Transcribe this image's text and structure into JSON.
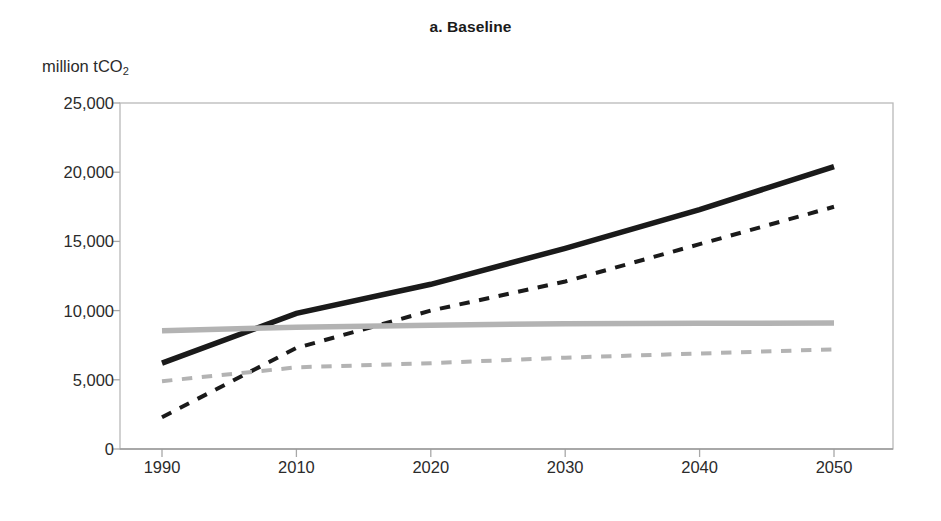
{
  "figure": {
    "title": "a. Baseline",
    "y_axis_unit_prefix": "million tCO",
    "y_axis_unit_subscript": "2"
  },
  "chart_data": {
    "type": "line",
    "title": "a. Baseline",
    "xlabel": "",
    "ylabel": "million tCO2",
    "ylim": [
      0,
      25000
    ],
    "xlim": [
      1990,
      2050
    ],
    "grid": false,
    "legend": "none",
    "y_ticks": [
      0,
      5000,
      10000,
      15000,
      20000,
      25000
    ],
    "y_tick_labels": [
      "0",
      "5,000",
      "10,000",
      "15,000",
      "20,000",
      "25,000"
    ],
    "x_ticks": [
      1990,
      2010,
      2020,
      2030,
      2040,
      2050
    ],
    "x_tick_labels": [
      "1990",
      "2010",
      "2020",
      "2030",
      "2040",
      "2050"
    ],
    "x": [
      1990,
      2010,
      2020,
      2030,
      2040,
      2050
    ],
    "series": [
      {
        "name": "series-black-solid",
        "style": "solid",
        "color": "#1a1a1a",
        "width": 5.5,
        "values": [
          6200,
          9800,
          11900,
          14500,
          17300,
          20400
        ]
      },
      {
        "name": "series-black-dashed",
        "style": "dashed",
        "color": "#1a1a1a",
        "width": 4,
        "values": [
          2300,
          7300,
          10000,
          12100,
          14800,
          17500
        ]
      },
      {
        "name": "series-gray-solid",
        "style": "solid",
        "color": "#b3b3b3",
        "width": 5.5,
        "values": [
          8550,
          8800,
          8950,
          9050,
          9080,
          9100
        ]
      },
      {
        "name": "series-gray-dashed",
        "style": "dashed",
        "color": "#b3b3b3",
        "width": 4,
        "values": [
          4900,
          5900,
          6200,
          6600,
          6900,
          7200
        ]
      }
    ]
  }
}
